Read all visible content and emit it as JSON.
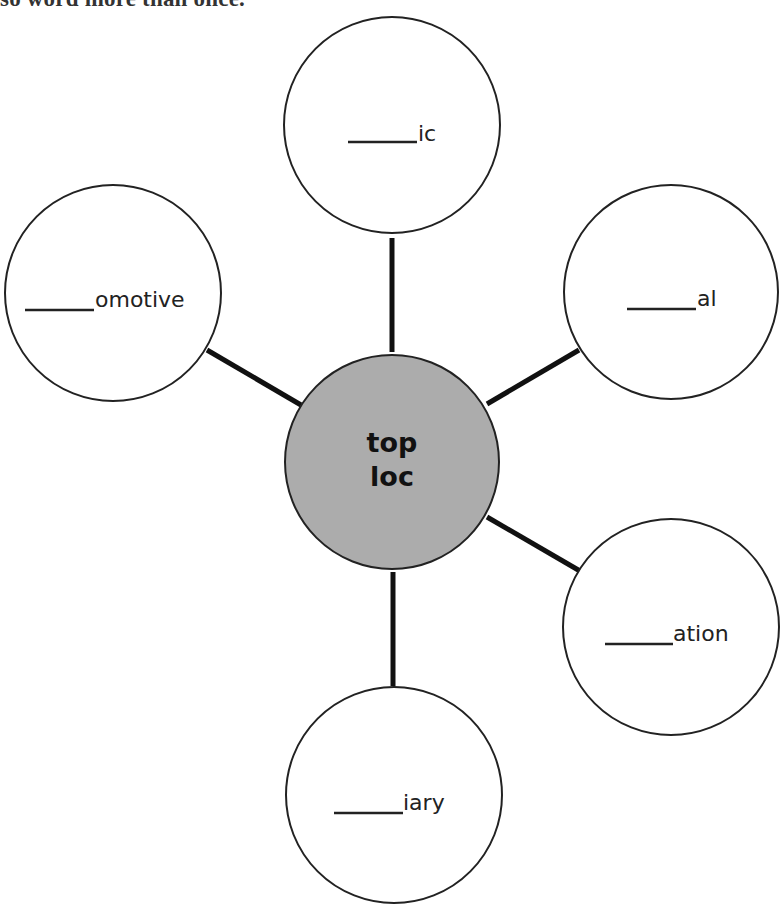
{
  "instruction": {
    "text": "so word more than once."
  },
  "hub": {
    "line1": "top",
    "line2": "loc",
    "fill": "#acacac"
  },
  "bubbles": [
    {
      "position": "top",
      "blank": "_____",
      "suffix": "ic"
    },
    {
      "position": "upper-left",
      "blank": "_____",
      "suffix": "omotive"
    },
    {
      "position": "upper-right",
      "blank": "_____",
      "suffix": "al"
    },
    {
      "position": "lower-right",
      "blank": "_____",
      "suffix": "ation"
    },
    {
      "position": "bottom",
      "blank": "_____",
      "suffix": "iary"
    }
  ],
  "colors": {
    "outline": "#222222",
    "connector": "#111111",
    "background": "#ffffff"
  }
}
